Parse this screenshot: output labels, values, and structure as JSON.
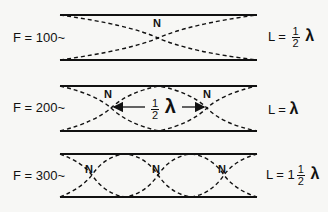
{
  "diagram": {
    "rows": [
      {
        "frequency_label": "F = 100~",
        "length_label": {
          "prefix": "L =",
          "whole": "",
          "num": "1",
          "den": "2",
          "symbol": "λ"
        },
        "nodes": [
          {
            "label": "N"
          }
        ]
      },
      {
        "frequency_label": "F = 200~",
        "length_label": {
          "prefix": "L =",
          "whole": "",
          "num": "",
          "den": "",
          "symbol": "λ"
        },
        "nodes": [
          {
            "label": "N"
          },
          {
            "label": "N"
          }
        ],
        "annotation": {
          "num": "1",
          "den": "2",
          "symbol": "λ"
        }
      },
      {
        "frequency_label": "F = 300~",
        "length_label": {
          "prefix": "L =",
          "whole": "1",
          "num": "1",
          "den": "2",
          "symbol": "λ"
        },
        "nodes": [
          {
            "label": "N"
          },
          {
            "label": "N"
          },
          {
            "label": "N"
          }
        ]
      }
    ],
    "colors": {
      "line": "#111111",
      "background": "#f7f7f5"
    }
  }
}
